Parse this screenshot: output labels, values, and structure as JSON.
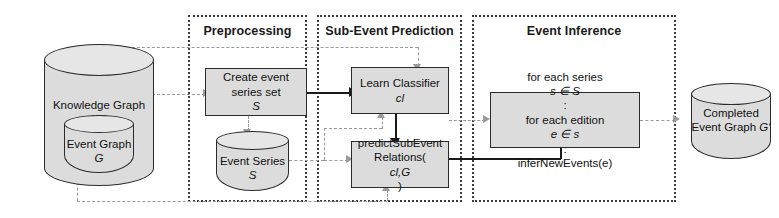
{
  "figure": {
    "background_color": "#ffffff",
    "box_fill": "#dcdcdc",
    "box_stroke": "#2b2b2b",
    "region_stroke": "#3a3a3a",
    "solid_flow_color": "#1a1a1a",
    "dashed_flow_color": "#9a9a9a"
  },
  "phases": [
    {
      "id": "preprocessing",
      "title": "Preprocessing"
    },
    {
      "id": "sub-event-prediction",
      "title": "Sub-Event Prediction"
    },
    {
      "id": "event-inference",
      "title": "Event Inference"
    }
  ],
  "datastores": [
    {
      "id": "knowledge-graph",
      "line1": "Knowledge",
      "line2": "Graph",
      "symbol": "KG"
    },
    {
      "id": "event-graph",
      "line1": "Event",
      "line2": "Graph",
      "symbol": "G"
    },
    {
      "id": "event-series",
      "line1": "Event",
      "line2": "Series",
      "symbol": "S"
    },
    {
      "id": "completed-event-graph",
      "line1": "Completed",
      "line2": "Event Graph",
      "symbol": "G′"
    }
  ],
  "processes": [
    {
      "id": "create-event-series-set",
      "line1": "Create event",
      "line2": "series set",
      "symbol2": "S"
    },
    {
      "id": "learn-classifier",
      "line1": "Learn Classifier",
      "symbol1": "cl"
    },
    {
      "id": "predict-sub-event-relations",
      "line1": "predictSubEvent",
      "line2pre": "Relations(",
      "line2sym": "cl,G",
      "line2post": ")"
    },
    {
      "id": "infer-new-events",
      "line1pre": "for each series ",
      "line1sym": "s ∈ S",
      "line1post": ":",
      "line2pre": "for each edition ",
      "line2sym": "e ∈ s",
      "line2post": ":",
      "line3": "inferNewEvents(e)"
    }
  ],
  "edges": [
    {
      "id": "kg-to-create-event-series",
      "style": "dashed"
    },
    {
      "id": "create-event-series-to-event-series",
      "style": "dashed"
    },
    {
      "id": "create-event-series-to-learn-classifier",
      "style": "solid"
    },
    {
      "id": "event-series-to-learn-classifier",
      "style": "dashed"
    },
    {
      "id": "event-series-to-predict-sub-event",
      "style": "dashed"
    },
    {
      "id": "top-dashed-to-learn-classifier",
      "style": "dashed"
    },
    {
      "id": "learn-classifier-to-predict-sub-event",
      "style": "solid"
    },
    {
      "id": "event-graph-to-predict-sub-event",
      "style": "dashed"
    },
    {
      "id": "predict-sub-event-to-infer-new-events",
      "style": "solid"
    },
    {
      "id": "event-series-to-infer-new-events",
      "style": "dashed"
    },
    {
      "id": "infer-new-events-to-completed-event-graph",
      "style": "dashed"
    }
  ]
}
